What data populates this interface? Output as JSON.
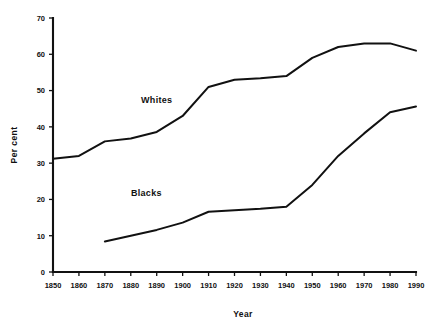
{
  "chart_data": {
    "type": "line",
    "title": "",
    "xlabel": "Year",
    "ylabel": "Per cent",
    "xlim": [
      1850,
      1990
    ],
    "ylim": [
      0,
      70
    ],
    "grid": false,
    "legend_position": "inline-annotations",
    "x": [
      1850,
      1860,
      1870,
      1880,
      1890,
      1900,
      1910,
      1920,
      1930,
      1940,
      1950,
      1960,
      1970,
      1980,
      1990
    ],
    "xticks": [
      "1850",
      "1860",
      "1870",
      "1880",
      "1890",
      "1900",
      "1910",
      "1920",
      "1930",
      "1940",
      "1950",
      "1960",
      "1970",
      "1980",
      "1990"
    ],
    "yticks": [
      "0",
      "10",
      "20",
      "30",
      "40",
      "50",
      "60",
      "70"
    ],
    "ytick_values": [
      0,
      10,
      20,
      30,
      40,
      50,
      60,
      70
    ],
    "series": [
      {
        "name": "Whites",
        "color": "#111111",
        "x": [
          1850,
          1860,
          1870,
          1880,
          1890,
          1900,
          1910,
          1920,
          1930,
          1940,
          1950,
          1960,
          1970,
          1980,
          1990
        ],
        "values": [
          31.2,
          32.0,
          36.0,
          36.8,
          38.6,
          43.0,
          51.0,
          53.0,
          53.4,
          54.0,
          59.0,
          62.0,
          63.0,
          63.0,
          61.0
        ],
        "label_text": "Whites",
        "label_x": 1890,
        "label_y": 46.5
      },
      {
        "name": "Blacks",
        "color": "#111111",
        "x": [
          1870,
          1880,
          1890,
          1900,
          1910,
          1920,
          1930,
          1940,
          1950,
          1960,
          1970,
          1980,
          1990
        ],
        "values": [
          8.4,
          10.0,
          11.6,
          13.6,
          16.6,
          17.0,
          17.4,
          18.0,
          24.0,
          32.0,
          38.2,
          44.0,
          45.6
        ],
        "label_text": "Blacks",
        "label_x": 1886,
        "label_y": 21.0
      }
    ],
    "annotations": [
      {
        "text": "Whites",
        "x": 1890,
        "y": 46.5
      },
      {
        "text": "Blacks",
        "x": 1886,
        "y": 21.0
      }
    ]
  },
  "axes": {
    "y_axis_title": "Per cent",
    "x_axis_title": "Year"
  }
}
